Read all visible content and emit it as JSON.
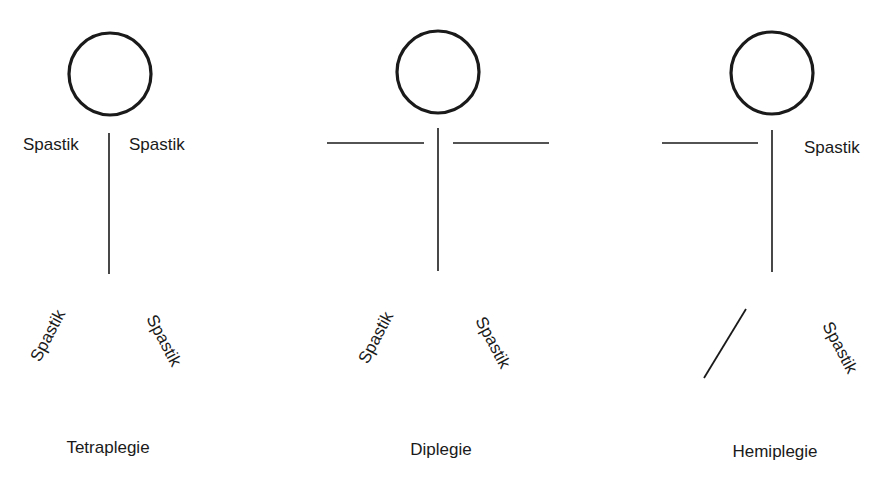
{
  "figures": [
    {
      "caption": "Tetraplegie",
      "labels": {
        "arm_left": "Spastik",
        "arm_right": "Spastik",
        "leg_left": "Spastik",
        "leg_right": "Spastik"
      }
    },
    {
      "caption": "Diplegie",
      "labels": {
        "leg_left": "Spastik",
        "leg_right": "Spastik"
      }
    },
    {
      "caption": "Hemiplegie",
      "labels": {
        "arm_right": "Spastik",
        "leg_right": "Spastik"
      }
    }
  ],
  "colors": {
    "stroke": "#1a1a1a",
    "background": "#ffffff"
  }
}
